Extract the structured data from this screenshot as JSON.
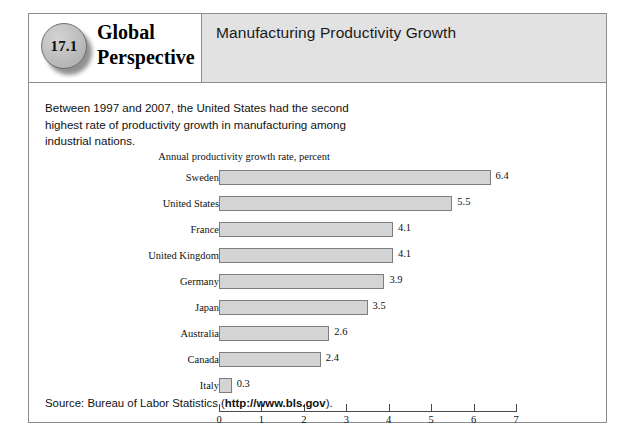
{
  "header": {
    "badge_number": "17.1",
    "series_title_line1": "Global",
    "series_title_line2": "Perspective",
    "panel_title": "Manufacturing Productivity Growth"
  },
  "body": {
    "intro_text": "Between 1997 and 2007, the United States had the second highest rate of productivity growth in manufacturing among industrial nations."
  },
  "source": {
    "prefix": "Source: Bureau of Labor Statistics (",
    "url": "http://www.bls.gov",
    "suffix": ")."
  },
  "chart_data": {
    "type": "bar",
    "orientation": "horizontal",
    "title": "Annual productivity growth rate, percent",
    "xlabel": "",
    "ylabel": "",
    "categories": [
      "Sweden",
      "United States",
      "France",
      "United Kingdom",
      "Germany",
      "Japan",
      "Australia",
      "Canada",
      "Italy"
    ],
    "values": [
      6.4,
      5.5,
      4.1,
      4.1,
      3.9,
      3.5,
      2.6,
      2.4,
      0.3
    ],
    "value_labels": [
      "6.4",
      "5.5",
      "4.1",
      "4.1",
      "3.9",
      "3.5",
      "2.6",
      "2.4",
      "0.3"
    ],
    "xlim": [
      0,
      7
    ],
    "xticks": [
      0,
      1,
      2,
      3,
      4,
      5,
      6,
      7
    ],
    "xtick_labels": [
      "0",
      "1",
      "2",
      "3",
      "4",
      "5",
      "6",
      "7"
    ],
    "grid": false,
    "legend": false,
    "bar_fill": "#d4d4d4",
    "bar_border": "#7d7d7d"
  }
}
